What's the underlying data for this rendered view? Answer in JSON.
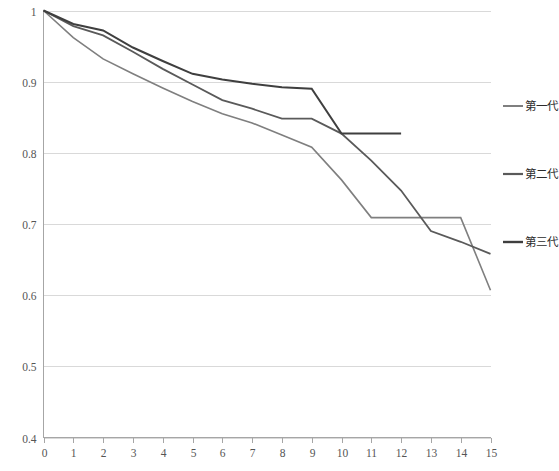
{
  "chart_data": {
    "type": "line",
    "title": "",
    "subtitle": "",
    "xlabel": "",
    "ylabel": "",
    "xlim": [
      0,
      15
    ],
    "ylim": [
      0.4,
      1.0
    ],
    "ytick_labels": [
      "0.4",
      "0.5",
      "0.6",
      "0.7",
      "0.8",
      "0.9",
      "1"
    ],
    "yticks": [
      0.4,
      0.5,
      0.6,
      0.7,
      0.8,
      0.9,
      1.0
    ],
    "xtick_labels": [
      "0",
      "1",
      "2",
      "3",
      "4",
      "5",
      "6",
      "7",
      "8",
      "9",
      "10",
      "11",
      "12",
      "13",
      "14",
      "15"
    ],
    "xticks": [
      0,
      1,
      2,
      3,
      4,
      5,
      6,
      7,
      8,
      9,
      10,
      11,
      12,
      13,
      14,
      15
    ],
    "grid": "horizontal",
    "legend_position": "right",
    "x": [
      0,
      1,
      2,
      3,
      4,
      5,
      6,
      7,
      8,
      9,
      10,
      11,
      12,
      13,
      14,
      15
    ],
    "series": [
      {
        "name": "第一代",
        "color": "#7f7f7f",
        "width": 1.6,
        "values": [
          1.0,
          0.962,
          0.932,
          0.911,
          0.891,
          0.872,
          0.855,
          0.842,
          0.825,
          0.808,
          0.762,
          0.709,
          0.709,
          0.709,
          0.709,
          0.607
        ]
      },
      {
        "name": "第二代",
        "color": "#5a5a5a",
        "width": 1.8,
        "values": [
          1.0,
          0.978,
          0.965,
          0.942,
          0.918,
          0.896,
          0.874,
          0.862,
          0.848,
          0.848,
          0.827,
          0.789,
          0.747,
          0.69,
          0.675,
          0.658
        ]
      },
      {
        "name": "第三代",
        "color": "#3f3f3f",
        "width": 2.0,
        "values": [
          1.0,
          0.981,
          0.972,
          0.948,
          0.929,
          0.911,
          0.903,
          0.897,
          0.892,
          0.89,
          0.827,
          0.827,
          0.827,
          null,
          null,
          null
        ]
      }
    ],
    "legend_entries": [
      {
        "label": "第一代",
        "color": "#7f7f7f"
      },
      {
        "label": "第二代",
        "color": "#5a5a5a"
      },
      {
        "label": "第三代",
        "color": "#3f3f3f"
      }
    ]
  },
  "axes": {
    "gridline_color": "#d9d9d9",
    "axis_color": "#a6a6a6"
  }
}
